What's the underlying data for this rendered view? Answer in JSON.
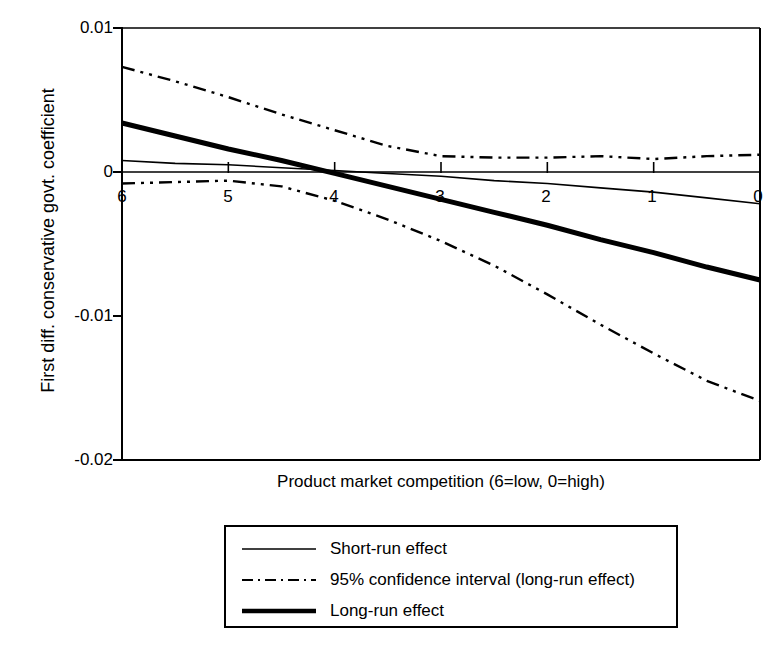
{
  "chart_data": {
    "type": "line",
    "title": "",
    "xlabel": "Product market competition (6=low, 0=high)",
    "ylabel": "First diff. conservative govt. coefficient",
    "xlim": [
      6,
      0
    ],
    "ylim": [
      -0.02,
      0.01
    ],
    "x_ticks": [
      6,
      5,
      4,
      3,
      2,
      1,
      0
    ],
    "x_tick_labels": [
      "6",
      "5",
      "4",
      "3",
      "2",
      "1",
      "0"
    ],
    "y_ticks": [
      0.01,
      0,
      -0.01,
      -0.02
    ],
    "y_tick_labels": [
      "0.01",
      "0",
      "-0.01",
      "-0.02"
    ],
    "grid": false,
    "legend_position": "below-plot",
    "x": [
      6,
      5.5,
      5,
      4.5,
      4,
      3.5,
      3,
      2.5,
      2,
      1.5,
      1,
      0.5,
      0
    ],
    "series": [
      {
        "name": "Short-run effect",
        "style": "solid-thin",
        "values": [
          0.0008,
          0.0006,
          0.0005,
          0.0003,
          0.0001,
          -0.0001,
          -0.0003,
          -0.0006,
          -0.0008,
          -0.0011,
          -0.0014,
          -0.0018,
          -0.0022
        ]
      },
      {
        "name": "95% confidence interval (long-run effect)",
        "style": "dash-dot-dot",
        "bound": "upper",
        "values": [
          0.0073,
          0.0063,
          0.0052,
          0.004,
          0.0029,
          0.0018,
          0.0011,
          0.001,
          0.001,
          0.0011,
          0.0009,
          0.0011,
          0.0012
        ]
      },
      {
        "name": "95% confidence interval (long-run effect)",
        "style": "dash-dot-dot",
        "bound": "lower",
        "values": [
          -0.0008,
          -0.0007,
          -0.0006,
          -0.001,
          -0.002,
          -0.0033,
          -0.0048,
          -0.0065,
          -0.0085,
          -0.0106,
          -0.0126,
          -0.0145,
          -0.0159
        ]
      },
      {
        "name": "Long-run effect",
        "style": "solid-thick",
        "values": [
          0.0034,
          0.0025,
          0.0016,
          0.0008,
          -0.0001,
          -0.001,
          -0.0019,
          -0.0028,
          -0.0037,
          -0.0047,
          -0.0056,
          -0.0066,
          -0.0075
        ]
      },
      {
        "name": "Zero reference line",
        "style": "solid-thin-ref",
        "values": [
          0,
          0,
          0,
          0,
          0,
          0,
          0,
          0,
          0,
          0,
          0,
          0,
          0
        ]
      }
    ]
  },
  "axes": {
    "ylabel": "First diff. conservative govt. coefficient",
    "xlabel": "Product market competition (6=low, 0=high)",
    "y_tick_labels": [
      "0.01",
      "0",
      "-0.01",
      "-0.02"
    ],
    "x_tick_labels": [
      "6",
      "5",
      "4",
      "3",
      "2",
      "1",
      "0"
    ]
  },
  "legend": {
    "entries": [
      {
        "label": "Short-run effect",
        "style": "solid-thin"
      },
      {
        "label": "95% confidence interval (long-run effect)",
        "style": "dash-dot-dot"
      },
      {
        "label": "Long-run effect",
        "style": "solid-thick"
      }
    ]
  },
  "colors": {
    "ink": "#000000",
    "background": "#ffffff"
  }
}
